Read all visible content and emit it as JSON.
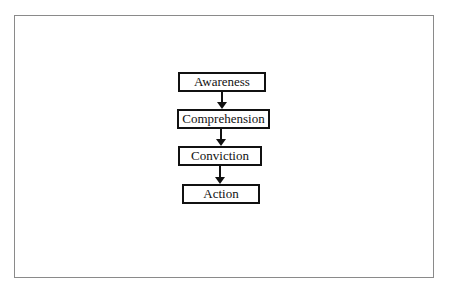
{
  "diagram": {
    "type": "vertical-flowchart",
    "nodes": [
      {
        "id": "awareness",
        "label": "Awareness"
      },
      {
        "id": "comprehension",
        "label": "Comprehension"
      },
      {
        "id": "conviction",
        "label": "Conviction"
      },
      {
        "id": "action",
        "label": "Action"
      }
    ],
    "edges": [
      {
        "from": "awareness",
        "to": "comprehension"
      },
      {
        "from": "comprehension",
        "to": "conviction"
      },
      {
        "from": "conviction",
        "to": "action"
      }
    ],
    "colors": {
      "frame_border": "#8a8a8a",
      "node_border": "#111111",
      "arrow": "#111111",
      "background": "#ffffff"
    }
  }
}
